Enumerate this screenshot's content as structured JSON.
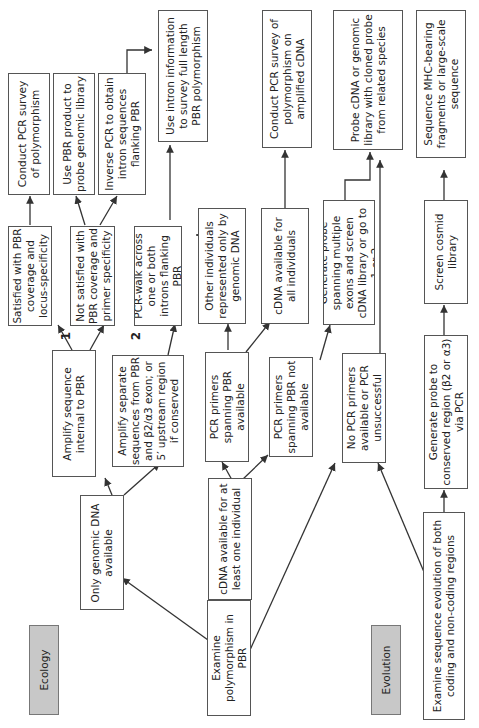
{
  "diagram": {
    "type": "flowchart",
    "orientation": "rotated-90-counterclockwise",
    "categories": {
      "ecology": "Ecology",
      "evolution": "Evolution"
    },
    "nodes": {
      "examine_pbr": "Examine polymorphism in PBR",
      "only_genomic": "Only genomic DNA available",
      "cdna_one": "cDNA available for at least one individual",
      "no_pcr": "No PCR primers available or PCR unsuccessful",
      "examine_evolution": "Examine sequence evolution of both coding and non-coding regions",
      "amplify_internal": "Amplify sequence internal to PBR",
      "amplify_separate": "Amplify separate sequences from PBR and β2/α3 exon; or 5′ upstream region if conserved",
      "pcr_spanning_avail": "PCR primers spanning PBR available",
      "pcr_spanning_not": "PCR primers spanning PBR not available",
      "generate_conserved": "Generate probe to conserved region (β2 or α3) via PCR",
      "satisfied": "Satisfied with PBR coverage and locus-specificity",
      "not_satisfied": "Not satisfied with PBR coverage and primer specificity",
      "pcr_walk": "PCR-walk across one or both introns flanking PBR",
      "other_individuals": "Other individuals represented only by genomic DNA",
      "cdna_all": "cDNA available for all individuals",
      "generate_multi": "Generate probe spanning multiple exons and screen cDNA library or go to 1 or 2",
      "screen_cosmid": "Screen cosmid library",
      "conduct_pcr": "Conduct PCR survey of polymorphism",
      "use_pbr_probe": "Use PBR product to probe genomic library",
      "inverse_pcr": "Inverse PCR to obtain intron sequences flanking PBR",
      "use_intron": "Use intron information to survey full length PBR polymorphism",
      "conduct_pcr_cdna": "Conduct PCR survey of polymorphism on amplified cDNA",
      "probe_cdna_genomic": "Probe cDNA or genomic library with cloned probe from related species",
      "sequence_mhc": "Sequence MHC-bearing fragments or large-scale sequence"
    },
    "markers": {
      "one": "1",
      "two": "2"
    },
    "colors": {
      "category_fill": "#c8c8c8",
      "box_border": "#555555",
      "arrow": "#333333"
    }
  }
}
